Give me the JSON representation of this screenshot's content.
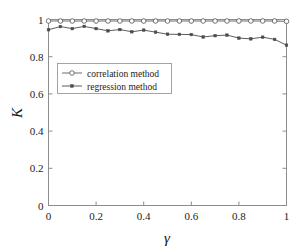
{
  "chart_data": {
    "type": "line",
    "title": "",
    "subtitle": "",
    "xlabel": "γ",
    "ylabel": "K",
    "xlim": [
      0,
      1
    ],
    "ylim": [
      0,
      1
    ],
    "grid": false,
    "legend_position": "upper-left-inside",
    "x_ticks": [
      "0",
      "0.2",
      "0.4",
      "0.6",
      "0.8",
      "1"
    ],
    "x_tick_values": [
      0,
      0.2,
      0.4,
      0.6,
      0.8,
      1
    ],
    "y_ticks": [
      "0",
      "0.2",
      "0.4",
      "0.6",
      "0.8",
      "1"
    ],
    "y_tick_values": [
      0,
      0.2,
      0.4,
      0.6,
      0.8,
      1
    ],
    "x": [
      0,
      0.05,
      0.1,
      0.15,
      0.2,
      0.25,
      0.3,
      0.35,
      0.4,
      0.45,
      0.5,
      0.55,
      0.6,
      0.65,
      0.7,
      0.75,
      0.8,
      0.85,
      0.9,
      0.95,
      1
    ],
    "series": [
      {
        "name": "correlation method",
        "marker": "open-circle",
        "color": "#5a5a5a",
        "values": [
          0.992,
          0.992,
          0.992,
          0.992,
          0.992,
          0.992,
          0.992,
          0.992,
          0.992,
          0.992,
          0.992,
          0.992,
          0.992,
          0.992,
          0.992,
          0.992,
          0.992,
          0.992,
          0.992,
          0.992,
          0.99
        ]
      },
      {
        "name": "regression method",
        "marker": "filled-square",
        "color": "#4a4a4a",
        "values": [
          0.945,
          0.962,
          0.951,
          0.963,
          0.951,
          0.939,
          0.946,
          0.934,
          0.943,
          0.932,
          0.921,
          0.92,
          0.919,
          0.906,
          0.913,
          0.916,
          0.9,
          0.896,
          0.905,
          0.893,
          0.862
        ]
      }
    ]
  },
  "legend": {
    "items": [
      {
        "label": "correlation method"
      },
      {
        "label": "regression method"
      }
    ]
  },
  "axes": {
    "x_title": "γ",
    "y_title": "K"
  }
}
